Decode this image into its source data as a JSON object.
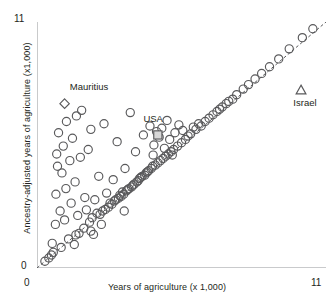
{
  "chart_data": {
    "type": "scatter",
    "title": "",
    "xlabel": "Years of agriculture (x 1,000)",
    "ylabel": "Ancestry-adjusted years of agriculture (x1,000)",
    "xlim": [
      0,
      11
    ],
    "ylim": [
      0,
      11
    ],
    "xticks": [
      0,
      1,
      2,
      3,
      4,
      5,
      6,
      7,
      8,
      9,
      10,
      11
    ],
    "yticks": [
      0,
      1,
      2,
      3,
      4,
      5,
      6,
      7,
      8,
      9,
      10,
      11
    ],
    "xtick_labels_shown": [
      "0",
      "11"
    ],
    "ytick_labels_shown": [
      "0",
      "11"
    ],
    "grid": false,
    "legend": "none",
    "reference_line": {
      "description": "45-degree dashed identity line y = x",
      "style": "dashed",
      "from": [
        0,
        0
      ],
      "to": [
        11,
        11
      ]
    },
    "annotations": [
      {
        "label": "Mauritius",
        "marker": "diamond",
        "x": 1.05,
        "y": 7.35,
        "label_dx": 0.2,
        "label_dy": 0.75
      },
      {
        "label": "USA",
        "marker": "square",
        "x": 4.6,
        "y": 5.95,
        "label_dx": -0.55,
        "label_dy": 0.7
      },
      {
        "label": "Israel",
        "marker": "triangle",
        "x": 10.05,
        "y": 7.95,
        "label_dx": 0.15,
        "label_dy": -0.55
      }
    ],
    "series": [
      {
        "name": "Countries",
        "marker": "open-circle",
        "points": [
          [
            0.3,
            0.3
          ],
          [
            0.45,
            0.45
          ],
          [
            0.55,
            0.58
          ],
          [
            0.62,
            0.7
          ],
          [
            0.7,
            1.95
          ],
          [
            0.72,
            3.3
          ],
          [
            0.75,
            5.1
          ],
          [
            0.78,
            4.55
          ],
          [
            0.82,
            6.05
          ],
          [
            0.88,
            2.55
          ],
          [
            0.95,
            4.25
          ],
          [
            1.0,
            5.45
          ],
          [
            1.05,
            2.15
          ],
          [
            1.1,
            3.55
          ],
          [
            1.12,
            6.55
          ],
          [
            1.2,
            1.3
          ],
          [
            1.25,
            4.8
          ],
          [
            1.3,
            2.9
          ],
          [
            1.35,
            5.8
          ],
          [
            1.42,
            1.05
          ],
          [
            1.45,
            3.85
          ],
          [
            1.5,
            6.8
          ],
          [
            1.55,
            2.35
          ],
          [
            1.6,
            1.55
          ],
          [
            1.65,
            4.95
          ],
          [
            1.7,
            7.05
          ],
          [
            1.78,
            1.78
          ],
          [
            1.82,
            3.15
          ],
          [
            1.88,
            2.6
          ],
          [
            1.95,
            5.3
          ],
          [
            2.0,
            2.05
          ],
          [
            2.05,
            6.2
          ],
          [
            2.1,
            2.25
          ],
          [
            2.15,
            1.5
          ],
          [
            2.2,
            3.05
          ],
          [
            2.28,
            2.45
          ],
          [
            2.35,
            4.1
          ],
          [
            2.4,
            2.4
          ],
          [
            2.45,
            1.95
          ],
          [
            2.5,
            2.55
          ],
          [
            2.55,
            6.45
          ],
          [
            2.6,
            2.62
          ],
          [
            2.65,
            3.35
          ],
          [
            2.72,
            2.72
          ],
          [
            2.78,
            2.9
          ],
          [
            2.85,
            2.85
          ],
          [
            2.9,
            3.95
          ],
          [
            2.95,
            3.0
          ],
          [
            3.0,
            3.05
          ],
          [
            3.05,
            5.65
          ],
          [
            3.1,
            3.12
          ],
          [
            3.15,
            3.25
          ],
          [
            3.2,
            3.2
          ],
          [
            3.25,
            3.4
          ],
          [
            3.3,
            3.3
          ],
          [
            3.35,
            4.45
          ],
          [
            3.4,
            3.45
          ],
          [
            3.45,
            3.5
          ],
          [
            3.5,
            3.55
          ],
          [
            3.55,
            6.95
          ],
          [
            3.6,
            3.62
          ],
          [
            3.65,
            3.7
          ],
          [
            3.7,
            3.75
          ],
          [
            3.75,
            5.2
          ],
          [
            3.8,
            3.85
          ],
          [
            3.85,
            3.9
          ],
          [
            3.9,
            4.0
          ],
          [
            3.95,
            4.05
          ],
          [
            4.0,
            4.1
          ],
          [
            4.05,
            5.95
          ],
          [
            4.1,
            4.15
          ],
          [
            4.15,
            4.25
          ],
          [
            4.2,
            4.3
          ],
          [
            4.25,
            4.35
          ],
          [
            4.3,
            6.35
          ],
          [
            4.35,
            4.45
          ],
          [
            4.4,
            4.55
          ],
          [
            4.45,
            5.5
          ],
          [
            4.5,
            4.6
          ],
          [
            4.55,
            6.1
          ],
          [
            4.6,
            4.7
          ],
          [
            4.65,
            5.85
          ],
          [
            4.7,
            4.8
          ],
          [
            4.75,
            6.25
          ],
          [
            4.8,
            4.9
          ],
          [
            4.85,
            5.35
          ],
          [
            4.9,
            5.0
          ],
          [
            4.95,
            6.6
          ],
          [
            5.0,
            5.1
          ],
          [
            5.05,
            5.75
          ],
          [
            5.1,
            5.2
          ],
          [
            5.2,
            5.3
          ],
          [
            5.25,
            6.05
          ],
          [
            5.35,
            5.45
          ],
          [
            5.4,
            6.4
          ],
          [
            5.5,
            5.6
          ],
          [
            5.55,
            6.15
          ],
          [
            5.65,
            5.75
          ],
          [
            5.75,
            5.9
          ],
          [
            5.85,
            6.0
          ],
          [
            5.95,
            6.3
          ],
          [
            6.05,
            6.2
          ],
          [
            6.15,
            6.45
          ],
          [
            6.25,
            6.35
          ],
          [
            6.4,
            6.55
          ],
          [
            6.55,
            6.7
          ],
          [
            6.7,
            6.85
          ],
          [
            6.85,
            7.0
          ],
          [
            7.05,
            7.2
          ],
          [
            7.2,
            7.35
          ],
          [
            7.45,
            7.55
          ],
          [
            7.6,
            7.75
          ],
          [
            7.85,
            8.0
          ],
          [
            8.05,
            8.2
          ],
          [
            8.3,
            8.45
          ],
          [
            8.55,
            8.7
          ],
          [
            8.85,
            9.0
          ],
          [
            9.2,
            9.35
          ],
          [
            9.6,
            9.8
          ],
          [
            10.1,
            10.3
          ],
          [
            10.5,
            10.7
          ],
          [
            7.3,
            7.45
          ],
          [
            6.95,
            7.1
          ],
          [
            5.15,
            5.05
          ],
          [
            4.42,
            5.05
          ],
          [
            3.32,
            2.55
          ],
          [
            2.05,
            1.65
          ],
          [
            1.48,
            1.48
          ],
          [
            0.92,
            0.92
          ],
          [
            0.58,
            1.1
          ]
        ]
      }
    ]
  },
  "labels": {
    "mauritius": "Mauritius",
    "usa": "USA",
    "israel": "Israel"
  },
  "axis": {
    "x_title": "Years of agriculture (x 1,000)",
    "y_title": "Ancestry-adjusted years of agriculture (x1,000)",
    "x_min": "0",
    "x_max": "11",
    "y_min": "0",
    "y_max": "11"
  },
  "colors": {
    "marker_stroke": "#59595b",
    "axis": "#939598",
    "text": "#231f20",
    "background": "#ffffff"
  }
}
